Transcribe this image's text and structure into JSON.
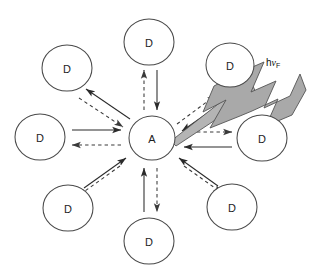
{
  "figure": {
    "kind": "energy-transfer-schematic",
    "background_color": "#ffffff",
    "stroke_color": "#2b2b2b",
    "bolt_fill_color": "#a9a9a9",
    "bolt_stroke_color": "#545454",
    "center_node": {
      "label": "A",
      "cx": 152,
      "cy": 138,
      "rx": 23,
      "ry": 22
    },
    "donor_label": "D",
    "donors": [
      {
        "id": "donor-top",
        "label": "D",
        "cx": 149,
        "cy": 42,
        "rx": 25,
        "ry": 23
      },
      {
        "id": "donor-upper-left",
        "label": "D",
        "cx": 67,
        "cy": 68,
        "rx": 25,
        "ry": 23
      },
      {
        "id": "donor-upper-right",
        "label": "D",
        "cx": 230,
        "cy": 65,
        "rx": 24,
        "ry": 22
      },
      {
        "id": "donor-left",
        "label": "D",
        "cx": 40,
        "cy": 137,
        "rx": 25,
        "ry": 23
      },
      {
        "id": "donor-right",
        "label": "D",
        "cx": 262,
        "cy": 138,
        "rx": 25,
        "ry": 23
      },
      {
        "id": "donor-lower-left",
        "label": "D",
        "cx": 68,
        "cy": 208,
        "rx": 25,
        "ry": 23
      },
      {
        "id": "donor-lower-right",
        "label": "D",
        "cx": 232,
        "cy": 207,
        "rx": 25,
        "ry": 23
      },
      {
        "id": "donor-bottom",
        "label": "D",
        "cx": 149,
        "cy": 241,
        "rx": 25,
        "ry": 23
      }
    ],
    "transfer_arrows": [
      {
        "id": "arrow-top-solid",
        "style": "solid",
        "x1": 157,
        "y1": 70,
        "x2": 157,
        "y2": 110
      },
      {
        "id": "arrow-top-dashed",
        "style": "dashed",
        "x1": 144,
        "y1": 110,
        "x2": 144,
        "y2": 70
      },
      {
        "id": "arrow-bottom-solid",
        "style": "solid",
        "x1": 144,
        "y1": 212,
        "x2": 144,
        "y2": 168
      },
      {
        "id": "arrow-bottom-dashed",
        "style": "dashed",
        "x1": 157,
        "y1": 168,
        "x2": 157,
        "y2": 212
      },
      {
        "id": "arrow-left-solid",
        "style": "solid",
        "x1": 72,
        "y1": 130,
        "x2": 121,
        "y2": 130
      },
      {
        "id": "arrow-left-dashed",
        "style": "dashed",
        "x1": 121,
        "y1": 145,
        "x2": 72,
        "y2": 145
      },
      {
        "id": "arrow-right-solid",
        "style": "solid",
        "x1": 232,
        "y1": 147,
        "x2": 184,
        "y2": 147
      },
      {
        "id": "arrow-right-dashed",
        "style": "dashed",
        "x1": 184,
        "y1": 132,
        "x2": 232,
        "y2": 132
      },
      {
        "id": "arrow-ul-solid",
        "style": "solid",
        "x1": 130,
        "y1": 119,
        "x2": 86,
        "y2": 89
      },
      {
        "id": "arrow-ul-dashed",
        "style": "dashed",
        "x1": 79,
        "y1": 98,
        "x2": 123,
        "y2": 127
      },
      {
        "id": "arrow-ur-dashed",
        "style": "dashed",
        "x1": 177,
        "y1": 124,
        "x2": 216,
        "y2": 95
      },
      {
        "id": "arrow-ur-solid",
        "style": "solid",
        "x1": 222,
        "y1": 103,
        "x2": 182,
        "y2": 131
      },
      {
        "id": "arrow-ll-solid",
        "style": "solid",
        "x1": 84,
        "y1": 188,
        "x2": 126,
        "y2": 158
      },
      {
        "id": "arrow-ll-dashed",
        "style": "dashed",
        "x1": 120,
        "y1": 166,
        "x2": 78,
        "y2": 196
      },
      {
        "id": "arrow-lr-solid",
        "style": "solid",
        "x1": 218,
        "y1": 186,
        "x2": 179,
        "y2": 158
      },
      {
        "id": "arrow-lr-dashed",
        "style": "dashed",
        "x1": 184,
        "y1": 166,
        "x2": 222,
        "y2": 193
      }
    ],
    "emission_bolt": {
      "id": "fluorescence-bolt",
      "origin_x": 171,
      "origin_y": 141,
      "tip_x": 300,
      "tip_y": 74,
      "label_text": "h",
      "label_symbol": "ν",
      "label_subscript": "F",
      "label_x": 266,
      "label_y": 66
    }
  }
}
